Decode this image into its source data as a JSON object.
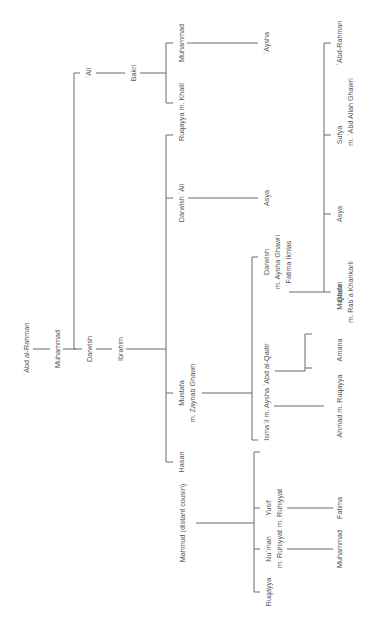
{
  "orientation": "rotated -90deg (text reads bottom-to-top)",
  "colors": {
    "line": "#6b6b6b",
    "text": "#555555",
    "background": "#ffffff"
  },
  "nodes": {
    "abd_al_rahman_root": "ʿAbd al-Rahman",
    "muhammad_gen1": "Muhammad",
    "ali": "ʿAli",
    "bakri": "Bakri",
    "muhammad_bakri": "Muhammad",
    "aysha_bakri": "ʿAysha",
    "ruqayya_khalil": "Ruqayya m. Khalil",
    "darwish_gen2": "Darwish",
    "ibrahim": "Ibrahim",
    "darwish_ali": "Darwish ʿAli",
    "asya_1": "Asya",
    "darwish_gen4": "Darwish",
    "darwish_gen4_m1": "m. Aysha Ghawri",
    "darwish_gen4_m2": "Fatima Ikhlas",
    "qasim": "Qasim",
    "qasim_m": "m. Rabʿa Khankarli",
    "asya_2": "Asya",
    "sufya": "Sufya",
    "sufya_m": "m. ʿAbd Allah Ghawri",
    "abd_rahman_leaf": "ʿAbd-Rahman",
    "mustafa": "Mustafa",
    "mustafa_m": "m. Zaynab Ghawri",
    "ismail": "Ismaʿil m. Aysha ʿAbd al-Qadir",
    "ahmad": "Ahmad m. Ruqayya",
    "amana": "Amana",
    "mustafa_2": "Mustafa",
    "hasan": "Hasan",
    "mahmud": "Mahmud (distant cousin)",
    "yusif": "Yusif",
    "yusif_m": "m. Ruhiyyat",
    "fatima": "Fatima",
    "numan": "Nuʿman",
    "numan_m": "m. Ruhiyyat",
    "muhammad_leaf": "Muhammad",
    "ruqayya_leaf": "Ruqayya"
  }
}
